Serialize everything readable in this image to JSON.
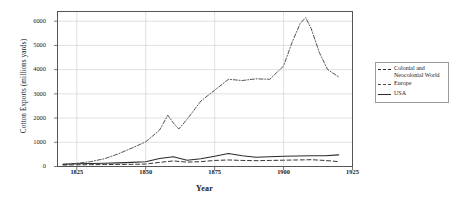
{
  "chart_data": {
    "type": "line",
    "title": "",
    "xlabel": "Year",
    "ylabel": "Cotton Exports (millions yards)",
    "xlim": [
      1818,
      1925
    ],
    "ylim": [
      0,
      6400
    ],
    "grid": true,
    "xticks": [
      1825,
      1850,
      1875,
      1900,
      1925
    ],
    "xtick_labels": [
      "1825",
      "1850",
      "1875",
      "1900",
      "1925"
    ],
    "yticks": [
      0,
      1000,
      2000,
      3000,
      4000,
      5000,
      6000
    ],
    "ytick_labels": [
      "0",
      "1000",
      "2000",
      "3000",
      "4000",
      "5000",
      "6000"
    ],
    "legend_position": "right-outside",
    "series": [
      {
        "name": "Colonial and\n  Neocolonial World",
        "style": "dashed",
        "color": "#2b2b2b",
        "x": [
          1820,
          1825,
          1830,
          1835,
          1840,
          1845,
          1850,
          1855,
          1860,
          1865,
          1870,
          1875,
          1880,
          1885,
          1890,
          1895,
          1900,
          1905,
          1910,
          1915,
          1920
        ],
        "values": [
          60,
          70,
          75,
          80,
          85,
          90,
          100,
          170,
          230,
          180,
          200,
          250,
          270,
          250,
          240,
          250,
          260,
          270,
          280,
          250,
          200
        ]
      },
      {
        "name": "Europe",
        "style": "dashdot",
        "color": "#4a4a4a",
        "x": [
          1820,
          1825,
          1830,
          1835,
          1840,
          1845,
          1850,
          1855,
          1858,
          1860,
          1862,
          1865,
          1868,
          1870,
          1875,
          1880,
          1885,
          1890,
          1895,
          1900,
          1903,
          1906,
          1908,
          1910,
          1913,
          1916,
          1920
        ],
        "values": [
          90,
          130,
          200,
          320,
          520,
          760,
          1020,
          1500,
          2120,
          1800,
          1550,
          1950,
          2400,
          2700,
          3150,
          3600,
          3550,
          3620,
          3600,
          4150,
          5100,
          5900,
          6150,
          5700,
          4700,
          4000,
          3700
        ]
      },
      {
        "name": "USA",
        "style": "solid",
        "color": "#2b2b2b",
        "x": [
          1820,
          1825,
          1830,
          1835,
          1840,
          1845,
          1850,
          1855,
          1860,
          1865,
          1870,
          1875,
          1880,
          1885,
          1890,
          1895,
          1900,
          1905,
          1910,
          1915,
          1920
        ],
        "values": [
          90,
          110,
          120,
          130,
          150,
          170,
          200,
          330,
          400,
          260,
          320,
          420,
          540,
          440,
          380,
          400,
          420,
          430,
          440,
          440,
          480
        ]
      }
    ]
  },
  "axes": {
    "xlabel": "Year",
    "ylabel": "Cotton Exports (millions yards)"
  },
  "legend": {
    "items": [
      {
        "label": "Colonial and\n  Neocolonial World",
        "style": "dashed"
      },
      {
        "label": "Europe",
        "style": "dashdot"
      },
      {
        "label": "USA",
        "style": "solid"
      }
    ]
  }
}
